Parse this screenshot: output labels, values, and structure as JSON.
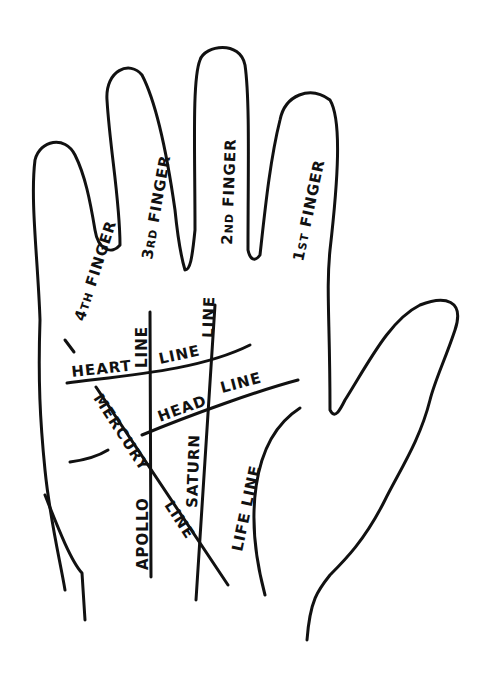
{
  "colors": {
    "ink": "#111111",
    "paper": "#ffffff"
  },
  "fingers": {
    "fourth": {
      "num": "4",
      "sup": "TH",
      "word": " FINGER"
    },
    "third": {
      "num": "3",
      "sup": "RD",
      "word": " FINGER"
    },
    "second": {
      "num": "2",
      "sup": "ND",
      "word": " FINGER"
    },
    "first": {
      "num": "1",
      "sup": "ST",
      "word": " FINGER"
    }
  },
  "lines": {
    "heart": {
      "a": "HEART",
      "b": "LINE"
    },
    "head": {
      "a": "HEAD",
      "b": "LINE"
    },
    "mercury": {
      "a": "MERCURY",
      "b": "LINE"
    },
    "apollo": {
      "a": "APOLLO",
      "b": "LINE"
    },
    "saturn": {
      "a": "SATURN",
      "b": "LINE"
    },
    "life": {
      "a": "LIFE LINE"
    }
  }
}
